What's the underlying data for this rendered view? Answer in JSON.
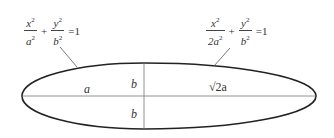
{
  "diagram": {
    "left_equation": {
      "term1": {
        "num": "x",
        "num_exp": "2",
        "den": "a",
        "den_exp": "2"
      },
      "plus": "+",
      "term2": {
        "num": "y",
        "num_exp": "2",
        "den": "b",
        "den_exp": "2"
      },
      "rhs": "=1"
    },
    "right_equation": {
      "term1": {
        "num": "x",
        "num_exp": "2",
        "den": "2a",
        "den_exp": "2"
      },
      "plus": "+",
      "term2": {
        "num": "y",
        "num_exp": "2",
        "den": "b",
        "den_exp": "2"
      },
      "rhs": "=1"
    },
    "labels": {
      "left_semi_axis": "a",
      "upper_b": "b",
      "lower_b": "b",
      "right_semi_axis": "√2a"
    },
    "colors": {
      "outline": "#222222",
      "lines": "#666666",
      "text": "#333333"
    }
  }
}
